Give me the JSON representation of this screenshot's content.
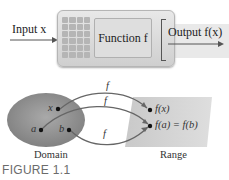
{
  "machine": {
    "input_label": "Input x",
    "function_label": "Function f",
    "output_label": "Output f(x)",
    "keypad": {
      "columns": 4,
      "rows": 6
    }
  },
  "mapping": {
    "domain_points": [
      "x",
      "a",
      "b"
    ],
    "range_points": [
      "f(x)",
      "f(a) = f(b)"
    ],
    "arrow_labels": [
      "f",
      "f",
      "f"
    ],
    "domain_label": "Domain",
    "range_label": "Range"
  },
  "caption": "FIGURE 1.1",
  "colors": {
    "domain_fill": "#8f8f8f",
    "range_fill": "#d3d3d3",
    "machine_fill": "#dcdcdc",
    "text": "#222222",
    "caption": "#6b6b6b"
  }
}
